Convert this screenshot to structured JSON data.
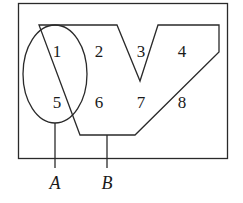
{
  "diagram": {
    "type": "venn-like set diagram",
    "universe": {
      "shape": "rectangle"
    },
    "sets": [
      {
        "name": "A",
        "shape": "ellipse",
        "label": "A"
      },
      {
        "name": "B",
        "shape": "polygon",
        "label": "B"
      }
    ],
    "regions": [
      {
        "id": "r1",
        "label": "1",
        "x": 57,
        "y": 57
      },
      {
        "id": "r2",
        "label": "2",
        "x": 99,
        "y": 57
      },
      {
        "id": "r3",
        "label": "3",
        "x": 141,
        "y": 57
      },
      {
        "id": "r4",
        "label": "4",
        "x": 182,
        "y": 57
      },
      {
        "id": "r5",
        "label": "5",
        "x": 57,
        "y": 108
      },
      {
        "id": "r6",
        "label": "6",
        "x": 99,
        "y": 108
      },
      {
        "id": "r7",
        "label": "7",
        "x": 141,
        "y": 108
      },
      {
        "id": "r8",
        "label": "8",
        "x": 182,
        "y": 108
      }
    ],
    "stroke_color": "#2a2a2a"
  }
}
